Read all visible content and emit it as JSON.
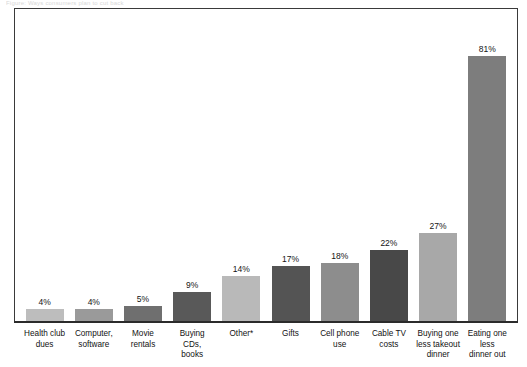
{
  "page": {
    "scan_sliver_text": "Figure: Ways consumers plan to cut back"
  },
  "chart_data": {
    "type": "bar",
    "title": "",
    "subtitle": "",
    "xlabel": "",
    "ylabel": "",
    "ylim": [
      0,
      91
    ],
    "grid": false,
    "legend": "none",
    "value_suffix": "%",
    "categories": [
      "Health club\ndues",
      "Computer,\nsoftware",
      "Movie\nrentals",
      "Buying CDs,\nbooks",
      "Other*",
      "Gifts",
      "Cell phone\nuse",
      "Cable TV\ncosts",
      "Buying one\nless takeout\ndinner",
      "Eating one\nless\ndinner out"
    ],
    "values": [
      4,
      4,
      5,
      9,
      14,
      17,
      18,
      22,
      27,
      81
    ],
    "value_labels": [
      "4%",
      "4%",
      "5%",
      "9%",
      "14%",
      "17%",
      "18%",
      "22%",
      "27%",
      "81%"
    ],
    "bar_colors": [
      "#bdbdbd",
      "#9a9a9a",
      "#6f6f6f",
      "#595959",
      "#b9b9b9",
      "#545454",
      "#8d8d8d",
      "#484848",
      "#a8a8a8",
      "#7d7d7d"
    ],
    "axis_color": "#2b2b2b",
    "frame_color": "#3a3a3a",
    "label_color": "#121212",
    "background": "#ffffff"
  }
}
